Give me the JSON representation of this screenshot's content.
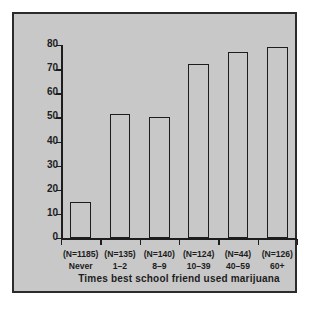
{
  "chart_data": {
    "type": "bar",
    "title": "",
    "xlabel": "Times best school friend used marijuana",
    "ylabel": "Adolescents having used marijuana (%)",
    "categories": [
      "Never",
      "1–2",
      "8–9",
      "10–39",
      "40–59",
      "60+"
    ],
    "group_sizes": [
      "(N=1185)",
      "(N=135)",
      "(N=140)",
      "(N=124)",
      "(N=44)",
      "(N=126)"
    ],
    "values": [
      15,
      51.5,
      50,
      72,
      77,
      79
    ],
    "ylim": [
      0,
      80
    ],
    "ytick_labels": [
      "0",
      "10",
      "20",
      "30",
      "40",
      "50",
      "60",
      "70",
      "80"
    ],
    "ytick_values": [
      0,
      10,
      20,
      30,
      40,
      50,
      60,
      70,
      80
    ],
    "grid": false,
    "legend": false,
    "bar_fill_color": "#c8c8c8",
    "bar_edge_color": "#1d1d1d",
    "plot_background_color": "#c8c8c8",
    "frame_color": "#2b2b2b",
    "figure_background_color": "#ffffff"
  }
}
